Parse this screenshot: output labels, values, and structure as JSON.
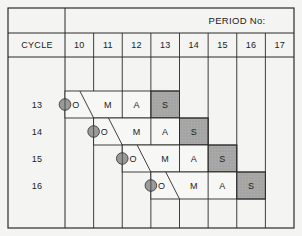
{
  "header": {
    "group_label": "PERIOD No:",
    "cycle_label": "CYCLE"
  },
  "periods": [
    "10",
    "11",
    "12",
    "13",
    "14",
    "15",
    "16",
    "17"
  ],
  "cycles": [
    {
      "cycle": "13",
      "start_period": "10",
      "steps": [
        "O",
        "M",
        "A",
        "S"
      ]
    },
    {
      "cycle": "14",
      "start_period": "11",
      "steps": [
        "O",
        "M",
        "A",
        "S"
      ]
    },
    {
      "cycle": "15",
      "start_period": "12",
      "steps": [
        "O",
        "M",
        "A",
        "S"
      ]
    },
    {
      "cycle": "16",
      "start_period": "13",
      "steps": [
        "O",
        "M",
        "A",
        "S"
      ]
    }
  ],
  "colors": {
    "line": "#2a2a2a",
    "shaded_cell": "#a9a9a9",
    "marker": "#9a9a9a",
    "background": "#f4f4f2"
  }
}
